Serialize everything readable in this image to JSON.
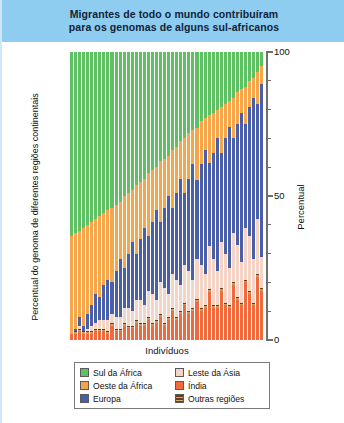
{
  "title": "Migrantes de todo o mundo contribuíram\npara os genomas de alguns sul-africanos",
  "axes": {
    "ylabel_left": "Percentual do genoma de diferentes regiões continentais",
    "ylabel_right": "Percentual",
    "xlabel": "Indivíduos",
    "ytick_labels": [
      "0",
      "50",
      "100"
    ]
  },
  "legend": {
    "items": [
      {
        "label": "Sul da África",
        "color": "#5fbf63"
      },
      {
        "label": "Leste da Ásia",
        "color": "#f4d4c6"
      },
      {
        "label": "Oeste da África",
        "color": "#f5a54a"
      },
      {
        "label": "Índia",
        "color": "#ef6a3c"
      },
      {
        "label": "Europa",
        "color": "#4a5fa8"
      },
      {
        "label": "Outras regiões",
        "color": "#6b3a1e"
      }
    ]
  },
  "chart_data": {
    "type": "bar",
    "stacked": true,
    "normalized": true,
    "title": "Migrantes de todo o mundo contribuíram para os genomas de alguns sul-africanos",
    "xlabel": "Indivíduos",
    "ylabel": "Percentual",
    "ylabel_secondary": "Percentual do genoma de diferentes regiões continentais",
    "ylim": [
      0,
      100
    ],
    "ytick_step": 10,
    "ytick_labeled": [
      0,
      50,
      100
    ],
    "grid": false,
    "legend_position": "bottom",
    "n_individuals": 48,
    "series": [
      {
        "name": "Sul da África",
        "color": "#5fbf63",
        "values": [
          64,
          63,
          62,
          61,
          60,
          59,
          58,
          57,
          56,
          55,
          54,
          53,
          52,
          50,
          49,
          48,
          46,
          45,
          44,
          42,
          41,
          40,
          38,
          37,
          36,
          34,
          33,
          31,
          30,
          28,
          27,
          26,
          24,
          23,
          22,
          21,
          20,
          19,
          18,
          17,
          16,
          14,
          13,
          12,
          10,
          9,
          7,
          5
        ]
      },
      {
        "name": "Oeste da África",
        "color": "#f5a54a",
        "values": [
          34,
          33,
          30,
          34,
          31,
          29,
          26,
          28,
          25,
          24,
          26,
          23,
          20,
          25,
          21,
          18,
          24,
          20,
          17,
          22,
          18,
          15,
          21,
          17,
          14,
          20,
          16,
          13,
          19,
          16,
          12,
          18,
          15,
          11,
          17,
          14,
          10,
          16,
          12,
          9,
          14,
          11,
          8,
          13,
          9,
          7,
          11,
          6
        ]
      },
      {
        "name": "Europa",
        "color": "#4a5fa8",
        "values": [
          0,
          1,
          3,
          2,
          5,
          7,
          10,
          8,
          12,
          14,
          11,
          16,
          20,
          14,
          19,
          24,
          16,
          21,
          27,
          19,
          25,
          31,
          21,
          28,
          34,
          23,
          30,
          37,
          25,
          32,
          40,
          27,
          35,
          43,
          29,
          37,
          46,
          31,
          40,
          49,
          33,
          42,
          52,
          36,
          45,
          56,
          40,
          60
        ]
      },
      {
        "name": "Leste da Ásia",
        "color": "#f4d4c6",
        "values": [
          0,
          0,
          1,
          0,
          1,
          2,
          2,
          3,
          3,
          4,
          3,
          4,
          4,
          5,
          6,
          5,
          7,
          8,
          6,
          9,
          10,
          7,
          11,
          12,
          8,
          12,
          13,
          9,
          13,
          14,
          10,
          14,
          15,
          11,
          15,
          16,
          12,
          16,
          17,
          13,
          17,
          18,
          14,
          18,
          19,
          15,
          19,
          11
        ]
      },
      {
        "name": "Índia",
        "color": "#ef6a3c",
        "values": [
          2,
          2,
          3,
          2,
          2,
          2,
          3,
          3,
          3,
          2,
          5,
          3,
          3,
          5,
          4,
          4,
          6,
          5,
          5,
          7,
          5,
          6,
          8,
          5,
          7,
          10,
          7,
          9,
          12,
          9,
          10,
          13,
          10,
          11,
          17,
          11,
          11,
          17,
          12,
          11,
          19,
          14,
          12,
          20,
          16,
          12,
          22,
          17
        ]
      },
      {
        "name": "Outras regiões",
        "color": "#6b3a1e",
        "values": [
          0,
          1,
          1,
          1,
          1,
          1,
          1,
          1,
          1,
          1,
          1,
          1,
          1,
          1,
          1,
          1,
          1,
          1,
          1,
          1,
          1,
          1,
          1,
          1,
          1,
          1,
          1,
          1,
          1,
          1,
          1,
          1,
          1,
          1,
          1,
          1,
          1,
          1,
          1,
          1,
          1,
          1,
          1,
          1,
          1,
          1,
          1,
          1
        ]
      }
    ]
  }
}
